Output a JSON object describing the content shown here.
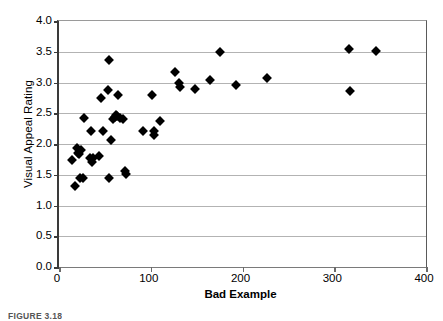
{
  "figure": {
    "caption": "FIGURE 3.18"
  },
  "chart_data": {
    "type": "scatter",
    "title": "",
    "xlabel": "Bad Example",
    "ylabel": "Visual Appeal Rating",
    "xlim": [
      0,
      400
    ],
    "ylim": [
      0,
      4.0
    ],
    "xticks": [
      0,
      100,
      200,
      300,
      400
    ],
    "xtick_labels": [
      "0",
      "100",
      "200",
      "300",
      "400"
    ],
    "yticks": [
      0.0,
      0.5,
      1.0,
      1.5,
      2.0,
      2.5,
      3.0,
      3.5,
      4.0
    ],
    "ytick_labels": [
      "0.0",
      "0.5",
      "1.0",
      "1.5",
      "2.0",
      "2.5",
      "3.0",
      "3.5",
      "4.0"
    ],
    "grid": "horizontal",
    "legend": "none",
    "marker": "diamond",
    "marker_color": "#000000",
    "series": [
      {
        "name": "Visual Appeal Rating vs Bad Example",
        "points": [
          [
            14,
            1.74
          ],
          [
            17,
            1.32
          ],
          [
            20,
            1.94
          ],
          [
            21,
            1.85
          ],
          [
            22,
            1.83
          ],
          [
            23,
            1.45
          ],
          [
            24,
            1.9
          ],
          [
            26,
            1.45
          ],
          [
            27,
            2.43
          ],
          [
            34,
            1.78
          ],
          [
            35,
            2.21
          ],
          [
            36,
            1.7
          ],
          [
            37,
            1.78
          ],
          [
            44,
            1.81
          ],
          [
            46,
            2.75
          ],
          [
            48,
            2.21
          ],
          [
            53,
            2.88
          ],
          [
            54,
            1.45
          ],
          [
            55,
            3.36
          ],
          [
            57,
            2.06
          ],
          [
            59,
            2.41
          ],
          [
            61,
            2.44
          ],
          [
            62,
            2.47
          ],
          [
            63,
            2.45
          ],
          [
            64,
            2.79
          ],
          [
            67,
            2.42
          ],
          [
            70,
            2.4
          ],
          [
            72,
            1.56
          ],
          [
            73,
            1.52
          ],
          [
            92,
            2.21
          ],
          [
            101,
            2.79
          ],
          [
            103,
            2.21
          ],
          [
            104,
            2.14
          ],
          [
            110,
            2.37
          ],
          [
            126,
            3.17
          ],
          [
            131,
            3.0
          ],
          [
            132,
            2.93
          ],
          [
            148,
            2.89
          ],
          [
            165,
            3.04
          ],
          [
            175,
            3.5
          ],
          [
            193,
            2.96
          ],
          [
            227,
            3.08
          ],
          [
            316,
            3.54
          ],
          [
            317,
            2.86
          ],
          [
            345,
            3.51
          ]
        ]
      }
    ]
  }
}
